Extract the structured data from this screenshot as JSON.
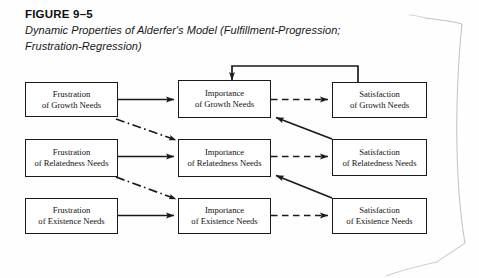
{
  "figure": {
    "number": "FIGURE 9–5",
    "title_line1": "Dynamic Properties of Alderfer's Model (Fulfillment-Progression;",
    "title_line2": "Frustration-Regression)"
  },
  "colors": {
    "ink": "#1a1a1a",
    "background": "#fefefe",
    "box_fill": "#ffffff"
  },
  "diagram": {
    "type": "flow-diagram",
    "columns": [
      "Frustration",
      "Importance",
      "Satisfaction"
    ],
    "rows": [
      "Growth",
      "Relatedness",
      "Existence"
    ],
    "nodes": [
      {
        "id": "frustration-growth",
        "line1": "Frustration",
        "line2": "of Growth Needs"
      },
      {
        "id": "importance-growth",
        "line1": "Importance",
        "line2": "of Growth Needs"
      },
      {
        "id": "satisfaction-growth",
        "line1": "Satisfaction",
        "line2": "of Growth Needs"
      },
      {
        "id": "frustration-relatedness",
        "line1": "Frustration",
        "line2": "of Relatedness Needs"
      },
      {
        "id": "importance-relatedness",
        "line1": "Importance",
        "line2": "of Relatedness Needs"
      },
      {
        "id": "satisfaction-relatedness",
        "line1": "Satisfaction",
        "line2": "of Relatedness Needs"
      },
      {
        "id": "frustration-existence",
        "line1": "Frustration",
        "line2": "of Existence Needs"
      },
      {
        "id": "importance-existence",
        "line1": "Importance",
        "line2": "of Existence Needs"
      },
      {
        "id": "satisfaction-existence",
        "line1": "Satisfaction",
        "line2": "of Existence Needs"
      }
    ],
    "edges": [
      {
        "id": "edge-frustration-to-importance-growth",
        "style": "solid",
        "from": "frustration-growth",
        "to": "importance-growth"
      },
      {
        "id": "edge-frustration-to-importance-relatedness",
        "style": "solid",
        "from": "frustration-relatedness",
        "to": "importance-relatedness"
      },
      {
        "id": "edge-frustration-to-importance-existence",
        "style": "solid",
        "from": "frustration-existence",
        "to": "importance-existence"
      },
      {
        "id": "edge-importance-to-satisfaction-growth",
        "style": "dashed",
        "from": "importance-growth",
        "to": "satisfaction-growth"
      },
      {
        "id": "edge-importance-to-satisfaction-relatedness",
        "style": "dashed",
        "from": "importance-relatedness",
        "to": "satisfaction-relatedness"
      },
      {
        "id": "edge-importance-to-satisfaction-existence",
        "style": "dashed",
        "from": "importance-existence",
        "to": "satisfaction-existence"
      },
      {
        "id": "edge-feedback-satisfaction-growth-to-importance-growth",
        "style": "solid",
        "from": "satisfaction-growth",
        "to": "importance-growth"
      },
      {
        "id": "edge-satisfaction-relatedness-to-importance-growth",
        "style": "solid",
        "from": "satisfaction-relatedness",
        "to": "importance-growth"
      },
      {
        "id": "edge-satisfaction-existence-to-importance-relatedness",
        "style": "solid",
        "from": "satisfaction-existence",
        "to": "importance-relatedness"
      },
      {
        "id": "edge-frustration-growth-to-importance-relatedness",
        "style": "dash-dot",
        "from": "frustration-growth",
        "to": "importance-relatedness"
      },
      {
        "id": "edge-frustration-relatedness-to-importance-existence",
        "style": "dash-dot",
        "from": "frustration-relatedness",
        "to": "importance-existence"
      }
    ]
  }
}
